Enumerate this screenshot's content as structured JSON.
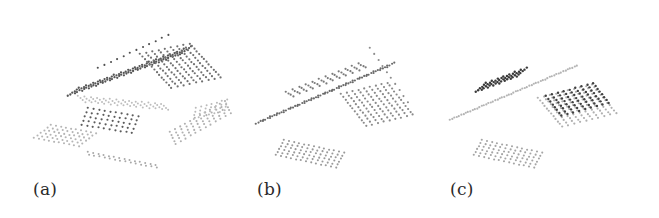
{
  "figure": {
    "panels": [
      {
        "id": "a",
        "label": "(a)",
        "x": 0,
        "width": 240,
        "label_x": 33,
        "patches": [
          {
            "name": "roof-ridge-dark",
            "o": [
              68,
              96
            ],
            "u": [
              7.0,
              -2.6
            ],
            "v": [
              2.2,
              -1.6
            ],
            "nu": 17,
            "nv": 6,
            "color": "#555555",
            "r": 1.15
          },
          {
            "name": "roof-plane-right",
            "o": [
              140,
              54
            ],
            "u": [
              2.4,
              2.6
            ],
            "v": [
              6.2,
              -1.3
            ],
            "nu": 14,
            "nv": 9,
            "color": "#707070",
            "r": 1.1
          },
          {
            "name": "roof-ridge-top",
            "o": [
              98,
              68
            ],
            "u": [
              6.4,
              -3.0
            ],
            "v": [
              0,
              0
            ],
            "nu": 12,
            "nv": 1,
            "color": "#4f4f4f",
            "r": 1.05
          },
          {
            "name": "ground-left",
            "o": [
              34,
              138
            ],
            "u": [
              5.0,
              0.9
            ],
            "v": [
              3.4,
              -2.6
            ],
            "nu": 10,
            "nv": 6,
            "color": "#b5b5b5",
            "r": 1.05
          },
          {
            "name": "ground-band-left",
            "o": [
              78,
              96
            ],
            "u": [
              6.4,
              0.6
            ],
            "v": [
              2.4,
              2.0
            ],
            "nu": 14,
            "nv": 4,
            "color": "#bdbdbd",
            "r": 1.0
          },
          {
            "name": "rooftop-mid-dark",
            "o": [
              88,
              108
            ],
            "u": [
              5.6,
              0.9
            ],
            "v": [
              -1.6,
              4.2
            ],
            "nu": 10,
            "nv": 5,
            "color": "#5c5c5c",
            "r": 1.1
          },
          {
            "name": "ground-front-strip",
            "o": [
              88,
              152
            ],
            "u": [
              5.2,
              1.0
            ],
            "v": [
              1.0,
              2.6
            ],
            "nu": 14,
            "nv": 2,
            "color": "#a8a8a8",
            "r": 1.0
          },
          {
            "name": "ground-right",
            "o": [
              170,
              132
            ],
            "u": [
              5.0,
              -2.8
            ],
            "v": [
              1.4,
              3.0
            ],
            "nu": 12,
            "nv": 5,
            "color": "#b0b0b0",
            "r": 1.05
          },
          {
            "name": "ground-right-far",
            "o": [
              196,
              108
            ],
            "u": [
              5.2,
              -1.4
            ],
            "v": [
              -0.8,
              3.6
            ],
            "nu": 7,
            "nv": 4,
            "color": "#bababa",
            "r": 1.0
          }
        ]
      },
      {
        "id": "b",
        "label": "(b)",
        "x": 220,
        "width": 220,
        "label_x": 37,
        "patches": [
          {
            "name": "roof-ridge",
            "o": [
              36,
              124
            ],
            "u": [
              6.9,
              -3.0
            ],
            "v": [
              2.4,
              -1.5
            ],
            "nu": 20,
            "nv": 4,
            "color": "#6a6a6a",
            "r": 1.1
          },
          {
            "name": "roof-ridge-inner",
            "o": [
              66,
              92
            ],
            "u": [
              6.6,
              -2.6
            ],
            "v": [
              2.4,
              1.4
            ],
            "nu": 12,
            "nv": 4,
            "color": "#7a7a7a",
            "r": 1.1
          },
          {
            "name": "roof-plane-right",
            "o": [
              121,
              94
            ],
            "u": [
              2.3,
              2.9
            ],
            "v": [
              5.8,
              -1.4
            ],
            "nu": 12,
            "nv": 9,
            "color": "#8a8a8a",
            "r": 1.1
          },
          {
            "name": "roof-edge-right",
            "o": [
              150,
              48
            ],
            "u": [
              4.2,
              6.0
            ],
            "v": [
              0,
              0
            ],
            "nu": 10,
            "nv": 1,
            "color": "#8c8c8c",
            "r": 1.05
          },
          {
            "name": "ground-patch",
            "o": [
              56,
              155
            ],
            "u": [
              5.0,
              1.05
            ],
            "v": [
              1.6,
              -3.0
            ],
            "nu": 13,
            "nv": 6,
            "color": "#9a9a9a",
            "r": 1.05
          }
        ]
      },
      {
        "id": "c",
        "label": "(c)",
        "x": 430,
        "width": 229,
        "label_x": 20,
        "patches": [
          {
            "name": "roof-ridge-light",
            "o": [
              20,
              120
            ],
            "u": [
              6.8,
              -2.9
            ],
            "v": [
              2.2,
              -1.2
            ],
            "nu": 19,
            "nv": 3,
            "color": "#b4b4b4",
            "r": 1.1
          },
          {
            "name": "roof-segment-dark",
            "o": [
              46,
              92
            ],
            "u": [
              5.8,
              -2.2
            ],
            "v": [
              2.0,
              -1.8
            ],
            "nu": 8,
            "nv": 6,
            "color": "#3a3a3a",
            "r": 1.2
          },
          {
            "name": "roof-plane-light",
            "o": [
              108,
              98
            ],
            "u": [
              2.2,
              2.6
            ],
            "v": [
              6.0,
              -1.5
            ],
            "nu": 12,
            "nv": 10,
            "color": "#b0b0b0",
            "r": 1.1
          },
          {
            "name": "roof-segment-right-dark",
            "o": [
              116,
              96
            ],
            "u": [
              5.9,
              -1.6
            ],
            "v": [
              2.2,
              2.8
            ],
            "nu": 9,
            "nv": 8,
            "color": "#404040",
            "r": 1.2
          },
          {
            "name": "ground-patch",
            "o": [
              44,
              155
            ],
            "u": [
              5.0,
              1.05
            ],
            "v": [
              1.6,
              -3.0
            ],
            "nu": 13,
            "nv": 6,
            "color": "#a5a5a5",
            "r": 1.05
          }
        ]
      }
    ]
  }
}
